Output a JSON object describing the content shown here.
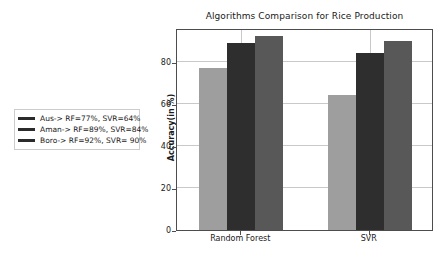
{
  "chart_data": {
    "type": "bar",
    "title": "Algorithms Comparison for Rice Production",
    "xlabel": "",
    "ylabel": "Accuracy(in %)",
    "categories": [
      "Random Forest",
      "SVR"
    ],
    "series": [
      {
        "name": "Aus",
        "values": [
          77,
          64
        ],
        "color": "#9e9e9e"
      },
      {
        "name": "Aman",
        "values": [
          89,
          84
        ],
        "color": "#2e2e2e"
      },
      {
        "name": "Boro",
        "values": [
          92,
          90
        ],
        "color": "#585858"
      }
    ],
    "ylim": [
      0,
      96
    ],
    "yticks": [
      0,
      20,
      40,
      60,
      80
    ],
    "ytick_labels": [
      "0",
      "20",
      "40",
      "60",
      "80"
    ],
    "grid": true,
    "legend_position": "outside-left",
    "legend_entries": [
      "Aus-> RF=77%, SVR=64%",
      "Aman-> RF=89%, SVR=84%",
      "Boro-> RF=92%, SVR= 90%"
    ]
  },
  "figure": {
    "background_color": "#ffffff",
    "axes_edge_color": "#4d4d4d",
    "grid_color": "#c9c9c9"
  }
}
